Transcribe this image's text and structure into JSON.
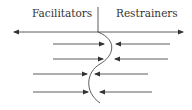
{
  "diagram": {
    "type": "force-field",
    "left_label": "Facilitators",
    "right_label": "Restrainers",
    "facilitator_arrows": 4,
    "restrainer_arrows": 4,
    "line_color": "#333333"
  }
}
